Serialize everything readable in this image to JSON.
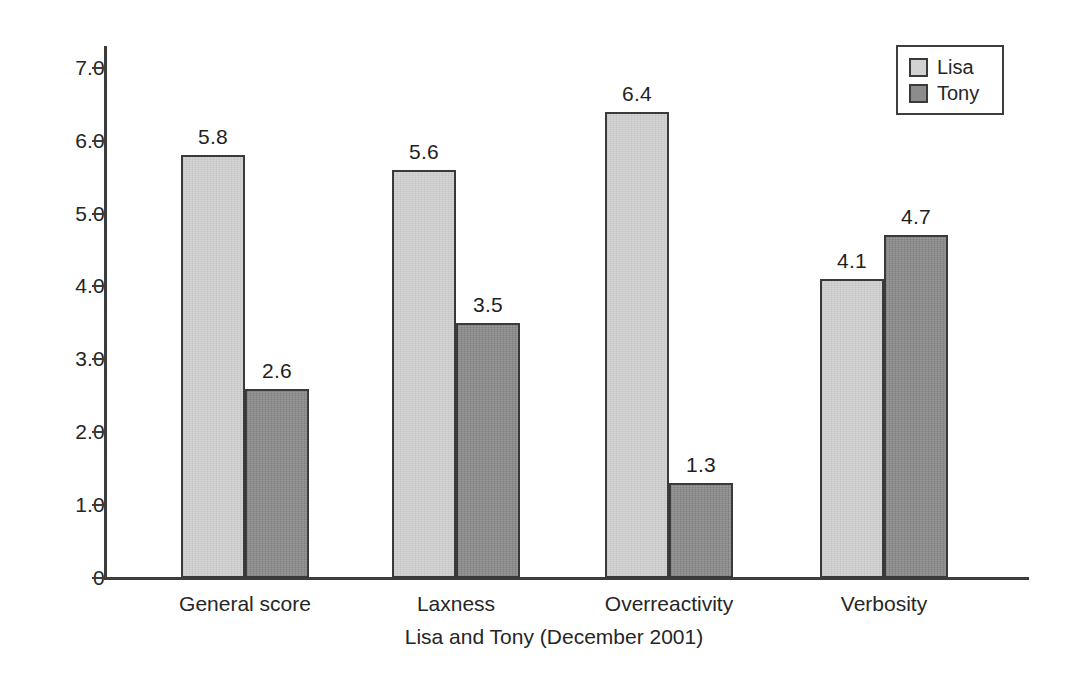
{
  "chart_data": {
    "type": "bar",
    "title": "",
    "xlabel": "Lisa and Tony (December 2001)",
    "ylabel": "",
    "categories": [
      "General score",
      "Laxness",
      "Overreactivity",
      "Verbosity"
    ],
    "series": [
      {
        "name": "Lisa",
        "color": "#d2d2d2",
        "values": [
          5.8,
          5.6,
          6.4,
          4.1
        ]
      },
      {
        "name": "Tony",
        "color": "#8c8c8c",
        "values": [
          2.6,
          3.5,
          1.3,
          4.7
        ]
      }
    ],
    "ylim": [
      0,
      7.3
    ],
    "y_ticks": [
      0,
      1.0,
      2.0,
      3.0,
      4.0,
      5.0,
      6.0,
      7.0
    ],
    "y_tick_labels": [
      "0",
      "1.0",
      "2.0",
      "3.0",
      "4.0",
      "5.0",
      "6.0",
      "7.0"
    ],
    "value_labels": [
      [
        "5.8",
        "2.6"
      ],
      [
        "5.6",
        "3.5"
      ],
      [
        "6.4",
        "1.3"
      ],
      [
        "4.1",
        "4.7"
      ]
    ],
    "grid": false,
    "legend": {
      "position": "top-right",
      "entries": [
        "Lisa",
        "Tony"
      ]
    },
    "bar_outline_color": "#3a3a3a",
    "axis_color": "#3d3d3d"
  }
}
